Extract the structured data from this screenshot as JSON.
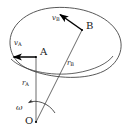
{
  "figure": {
    "type": "mechanics-diagram",
    "background_color": "#ffffff",
    "stroke_color": "#3a3a3a",
    "vector_color": "#000000",
    "text_color": "#1a1a1a",
    "width": 126,
    "height": 138
  },
  "labels": {
    "point_a": "A",
    "point_b": "B",
    "point_o": "O",
    "velocity_a": "v",
    "velocity_a_sub": "A",
    "velocity_b": "v",
    "velocity_b_sub": "B",
    "radius_a": "r",
    "radius_a_sub": "A",
    "radius_b": "r",
    "radius_b_sub": "B",
    "angular_velocity": "ω"
  },
  "geometry": {
    "body_outline": "M 10,44 C 9,26 26,11 50,8 C 76,5 104,13 116,30 C 126,44 121,62 104,71 C 86,80 56,79 33,71 C 17,65 11,56 10,44 Z",
    "point_a": {
      "x": 36,
      "y": 57
    },
    "point_b": {
      "x": 82,
      "y": 30
    },
    "point_o": {
      "x": 36,
      "y": 122
    },
    "velocity_a_tip": {
      "x": 11,
      "y": 57
    },
    "velocity_b_tip": {
      "x": 58,
      "y": 13
    },
    "omega_arc": "M 27,103 C 36,99 49,103 55,113",
    "hidden_edge": "M 11,59 C 22,70 50,77 76,73 C 95,70 108,63 113,56"
  },
  "label_positions": {
    "point_a": {
      "x": 40,
      "y": 52
    },
    "point_b": {
      "x": 86,
      "y": 25
    },
    "point_o": {
      "x": 26,
      "y": 119
    },
    "velocity_a": {
      "x": 15,
      "y": 44
    },
    "velocity_b": {
      "x": 53,
      "y": 19
    },
    "radius_a": {
      "x": 23,
      "y": 84
    },
    "radius_b": {
      "x": 68,
      "y": 64
    },
    "angular_velocity": {
      "x": 17,
      "y": 107
    }
  }
}
